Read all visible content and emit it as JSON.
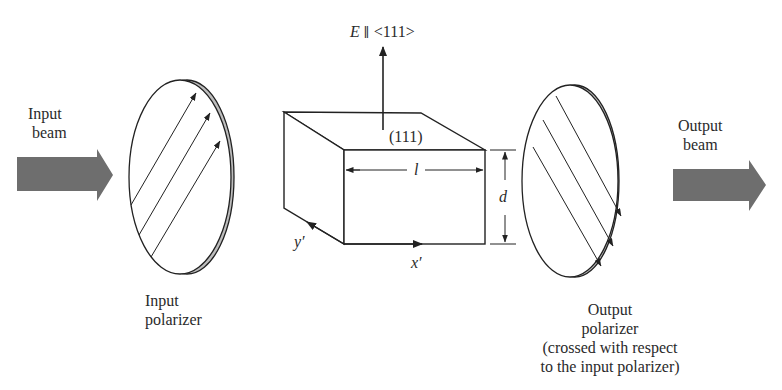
{
  "figure": {
    "colors": {
      "beam_arrow": "#6e6e6e",
      "polarizer_rim": "#bdbdbd",
      "line": "#222222",
      "background": "#ffffff"
    },
    "input_beam": {
      "line1": "Input",
      "line2": "beam"
    },
    "input_polarizer": {
      "line1": "Input",
      "line2": "polarizer"
    },
    "field": {
      "label": "E ∥ <111>",
      "symbol": "E",
      "parallel": "∥",
      "direction": "<111>"
    },
    "crystal": {
      "face_label": "(111)",
      "length_label": "l",
      "thickness_label": "d",
      "x_axis_label": "x′",
      "y_axis_label": "y′"
    },
    "output_polarizer": {
      "line1": "Output",
      "line2": "polarizer",
      "note_line1": "(crossed with respect",
      "note_line2": "to the input polarizer)"
    },
    "output_beam": {
      "line1": "Output",
      "line2": "beam"
    }
  }
}
